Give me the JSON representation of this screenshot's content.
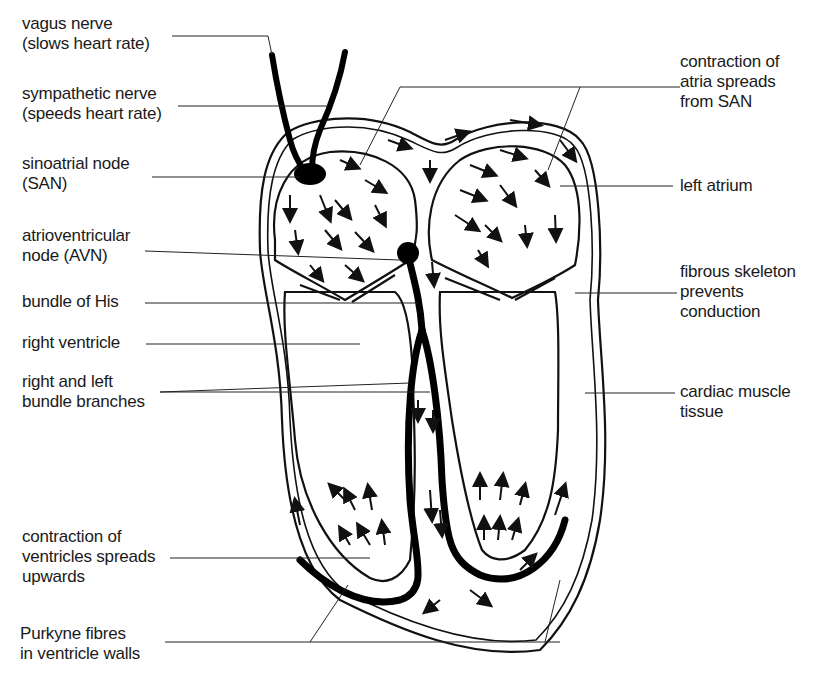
{
  "diagram": {
    "colors": {
      "ink": "#111111",
      "background": "#ffffff",
      "stipple": "#555555"
    }
  },
  "labels": {
    "vagus": {
      "line1": "vagus nerve",
      "line2": "(slows heart rate)"
    },
    "sympathetic": {
      "line1": "sympathetic nerve",
      "line2": "(speeds heart rate)"
    },
    "san": {
      "line1": "sinoatrial node",
      "line2": "(SAN)"
    },
    "avn": {
      "line1": "atrioventricular",
      "line2": "node (AVN)"
    },
    "his": {
      "line1": "bundle of His"
    },
    "right_ventricle": {
      "line1": "right ventricle"
    },
    "bundle_branches": {
      "line1": "right and left",
      "line2": "bundle branches"
    },
    "ventricle_contraction": {
      "line1": "contraction of",
      "line2": "ventricles spreads",
      "line3": "upwards"
    },
    "purkyne": {
      "line1": "Purkyne fibres",
      "line2": "in ventricle walls"
    },
    "atria_contraction": {
      "line1": "contraction of",
      "line2": "atria spreads",
      "line3": "from SAN"
    },
    "left_atrium": {
      "line1": "left atrium"
    },
    "fibrous_skeleton": {
      "line1": "fibrous skeleton",
      "line2": "prevents",
      "line3": "conduction"
    },
    "cardiac_muscle": {
      "line1": "cardiac muscle",
      "line2": "tissue"
    }
  }
}
